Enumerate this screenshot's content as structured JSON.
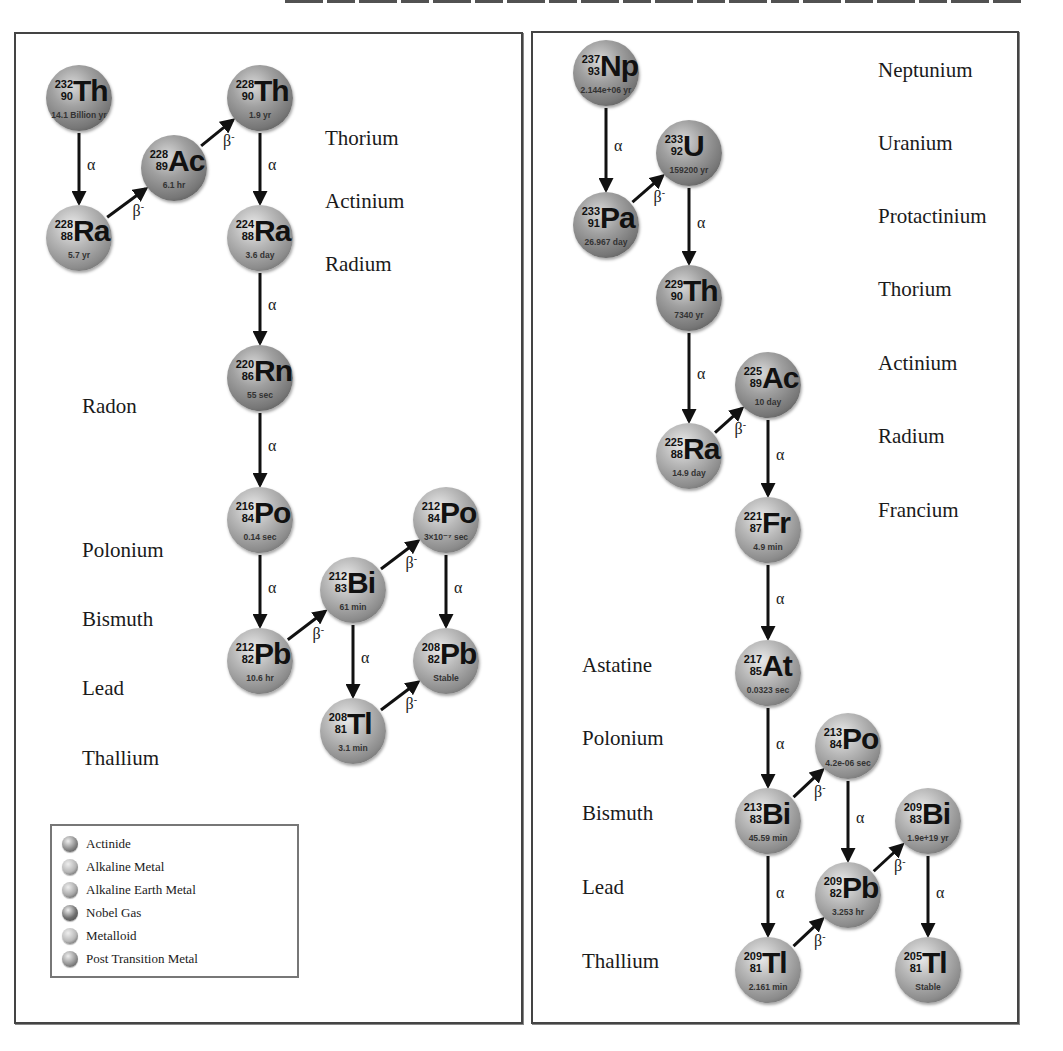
{
  "header": {
    "text_cut_off": true
  },
  "left_chain": {
    "element_labels": [
      {
        "text": "Thorium",
        "x": 325,
        "y": 140
      },
      {
        "text": "Actinium",
        "x": 325,
        "y": 203
      },
      {
        "text": "Radium",
        "x": 325,
        "y": 266
      },
      {
        "text": "Radon",
        "x": 82,
        "y": 408
      },
      {
        "text": "Polonium",
        "x": 82,
        "y": 552
      },
      {
        "text": "Bismuth",
        "x": 82,
        "y": 621
      },
      {
        "text": "Lead",
        "x": 82,
        "y": 690
      },
      {
        "text": "Thallium",
        "x": 82,
        "y": 760
      }
    ],
    "nodes": [
      {
        "id": "Th232",
        "mass": "232",
        "z": "90",
        "sym": "Th",
        "hl": "14.1 Billion yr",
        "x": 46,
        "y": 65,
        "cat": "actinide"
      },
      {
        "id": "Ra228",
        "mass": "228",
        "z": "88",
        "sym": "Ra",
        "hl": "5.7 yr",
        "x": 46,
        "y": 205,
        "cat": "alkaline-earth"
      },
      {
        "id": "Ac228",
        "mass": "228",
        "z": "89",
        "sym": "Ac",
        "hl": "6.1 hr",
        "x": 141,
        "y": 135,
        "cat": "actinide"
      },
      {
        "id": "Th228",
        "mass": "228",
        "z": "90",
        "sym": "Th",
        "hl": "1.9 yr",
        "x": 227,
        "y": 65,
        "cat": "actinide"
      },
      {
        "id": "Ra224",
        "mass": "224",
        "z": "88",
        "sym": "Ra",
        "hl": "3.6 day",
        "x": 227,
        "y": 205,
        "cat": "alkaline-earth"
      },
      {
        "id": "Rn220",
        "mass": "220",
        "z": "86",
        "sym": "Rn",
        "hl": "55 sec",
        "x": 227,
        "y": 345,
        "cat": "noble-gas"
      },
      {
        "id": "Po216",
        "mass": "216",
        "z": "84",
        "sym": "Po",
        "hl": "0.14 sec",
        "x": 227,
        "y": 487,
        "cat": "metalloid"
      },
      {
        "id": "Pb212",
        "mass": "212",
        "z": "82",
        "sym": "Pb",
        "hl": "10.6 hr",
        "x": 227,
        "y": 628,
        "cat": "post-transition"
      },
      {
        "id": "Bi212",
        "mass": "212",
        "z": "83",
        "sym": "Bi",
        "hl": "61 min",
        "x": 320,
        "y": 557,
        "cat": "post-transition"
      },
      {
        "id": "Po212",
        "mass": "212",
        "z": "84",
        "sym": "Po",
        "hl": "3×10⁻⁷ sec",
        "x": 413,
        "y": 487,
        "cat": "metalloid"
      },
      {
        "id": "Pb208",
        "mass": "208",
        "z": "82",
        "sym": "Pb",
        "hl": "Stable",
        "x": 413,
        "y": 628,
        "cat": "post-transition"
      },
      {
        "id": "Tl208",
        "mass": "208",
        "z": "81",
        "sym": "Tl",
        "hl": "3.1 min",
        "x": 320,
        "y": 698,
        "cat": "post-transition"
      }
    ],
    "decays": [
      {
        "from": "Th232",
        "to": "Ra228",
        "type": "α"
      },
      {
        "from": "Ra228",
        "to": "Ac228",
        "type": "β-"
      },
      {
        "from": "Ac228",
        "to": "Th228",
        "type": "β-"
      },
      {
        "from": "Th228",
        "to": "Ra224",
        "type": "α"
      },
      {
        "from": "Ra224",
        "to": "Rn220",
        "type": "α"
      },
      {
        "from": "Rn220",
        "to": "Po216",
        "type": "α"
      },
      {
        "from": "Po216",
        "to": "Pb212",
        "type": "α"
      },
      {
        "from": "Pb212",
        "to": "Bi212",
        "type": "β-"
      },
      {
        "from": "Bi212",
        "to": "Po212",
        "type": "β-"
      },
      {
        "from": "Bi212",
        "to": "Tl208",
        "type": "α"
      },
      {
        "from": "Po212",
        "to": "Pb208",
        "type": "α"
      },
      {
        "from": "Tl208",
        "to": "Pb208",
        "type": "β-"
      }
    ]
  },
  "right_chain": {
    "element_labels": [
      {
        "text": "Neptunium",
        "x": 878,
        "y": 72
      },
      {
        "text": "Uranium",
        "x": 878,
        "y": 145
      },
      {
        "text": "Protactinium",
        "x": 878,
        "y": 218
      },
      {
        "text": "Thorium",
        "x": 878,
        "y": 291
      },
      {
        "text": "Actinium",
        "x": 878,
        "y": 365
      },
      {
        "text": "Radium",
        "x": 878,
        "y": 438
      },
      {
        "text": "Francium",
        "x": 878,
        "y": 512
      },
      {
        "text": "Astatine",
        "x": 582,
        "y": 667
      },
      {
        "text": "Polonium",
        "x": 582,
        "y": 740
      },
      {
        "text": "Bismuth",
        "x": 582,
        "y": 815
      },
      {
        "text": "Lead",
        "x": 582,
        "y": 889
      },
      {
        "text": "Thallium",
        "x": 582,
        "y": 963
      }
    ],
    "nodes": [
      {
        "id": "Np237",
        "mass": "237",
        "z": "93",
        "sym": "Np",
        "hl": "2.144e+06 yr",
        "x": 573,
        "y": 40,
        "cat": "actinide"
      },
      {
        "id": "U233",
        "mass": "233",
        "z": "92",
        "sym": "U",
        "hl": "159200 yr",
        "x": 656,
        "y": 120,
        "cat": "actinide"
      },
      {
        "id": "Pa233",
        "mass": "233",
        "z": "91",
        "sym": "Pa",
        "hl": "26.967 day",
        "x": 573,
        "y": 192,
        "cat": "actinide"
      },
      {
        "id": "Th229",
        "mass": "229",
        "z": "90",
        "sym": "Th",
        "hl": "7340 yr",
        "x": 656,
        "y": 265,
        "cat": "actinide"
      },
      {
        "id": "Ac225",
        "mass": "225",
        "z": "89",
        "sym": "Ac",
        "hl": "10 day",
        "x": 735,
        "y": 352,
        "cat": "actinide"
      },
      {
        "id": "Ra225",
        "mass": "225",
        "z": "88",
        "sym": "Ra",
        "hl": "14.9 day",
        "x": 656,
        "y": 423,
        "cat": "alkaline-earth"
      },
      {
        "id": "Fr221",
        "mass": "221",
        "z": "87",
        "sym": "Fr",
        "hl": "4.9 min",
        "x": 735,
        "y": 497,
        "cat": "alkaline"
      },
      {
        "id": "At217",
        "mass": "217",
        "z": "85",
        "sym": "At",
        "hl": "0.0323 sec",
        "x": 735,
        "y": 640,
        "cat": "metalloid"
      },
      {
        "id": "Po213",
        "mass": "213",
        "z": "84",
        "sym": "Po",
        "hl": "4.2e-06 sec",
        "x": 815,
        "y": 713,
        "cat": "metalloid"
      },
      {
        "id": "Bi213",
        "mass": "213",
        "z": "83",
        "sym": "Bi",
        "hl": "45.59 min",
        "x": 735,
        "y": 788,
        "cat": "post-transition"
      },
      {
        "id": "Pb209",
        "mass": "209",
        "z": "82",
        "sym": "Pb",
        "hl": "3.253 hr",
        "x": 815,
        "y": 862,
        "cat": "post-transition"
      },
      {
        "id": "Bi209",
        "mass": "209",
        "z": "83",
        "sym": "Bi",
        "hl": "1.9e+19 yr",
        "x": 895,
        "y": 788,
        "cat": "post-transition"
      },
      {
        "id": "Tl209",
        "mass": "209",
        "z": "81",
        "sym": "Tl",
        "hl": "2.161 min",
        "x": 735,
        "y": 937,
        "cat": "post-transition"
      },
      {
        "id": "Tl205",
        "mass": "205",
        "z": "81",
        "sym": "Tl",
        "hl": "Stable",
        "x": 895,
        "y": 937,
        "cat": "post-transition"
      }
    ],
    "decays": [
      {
        "from": "Np237",
        "to": "Pa233",
        "type": "α"
      },
      {
        "from": "Pa233",
        "to": "U233",
        "type": "β-"
      },
      {
        "from": "U233",
        "to": "Th229",
        "type": "α"
      },
      {
        "from": "Th229",
        "to": "Ra225",
        "type": "α"
      },
      {
        "from": "Ra225",
        "to": "Ac225",
        "type": "β-"
      },
      {
        "from": "Ac225",
        "to": "Fr221",
        "type": "α"
      },
      {
        "from": "Fr221",
        "to": "At217",
        "type": "α"
      },
      {
        "from": "At217",
        "to": "Bi213",
        "type": "α"
      },
      {
        "from": "Bi213",
        "to": "Po213",
        "type": "β-"
      },
      {
        "from": "Bi213",
        "to": "Tl209",
        "type": "α"
      },
      {
        "from": "Po213",
        "to": "Pb209",
        "type": "α"
      },
      {
        "from": "Tl209",
        "to": "Pb209",
        "type": "β-"
      },
      {
        "from": "Pb209",
        "to": "Bi209",
        "type": "β-"
      },
      {
        "from": "Bi209",
        "to": "Tl205",
        "type": "α"
      }
    ]
  },
  "legend": {
    "items": [
      {
        "label": "Actinide",
        "cat": "actinide",
        "color": "#8a8a8a"
      },
      {
        "label": "Alkaline Metal",
        "cat": "alkaline",
        "color": "#b5b5b5"
      },
      {
        "label": "Alkaline Earth Metal",
        "cat": "alkaline-earth",
        "color": "#a9a9a9"
      },
      {
        "label": "Nobel Gas",
        "cat": "noble-gas",
        "color": "#6e6e6e"
      },
      {
        "label": "Metalloid",
        "cat": "metalloid",
        "color": "#b8b8b8"
      },
      {
        "label": "Post Transition Metal",
        "cat": "post-transition",
        "color": "#949494"
      }
    ]
  },
  "decay_symbols": {
    "alpha": "α",
    "beta": "β",
    "beta_sup": "-"
  }
}
